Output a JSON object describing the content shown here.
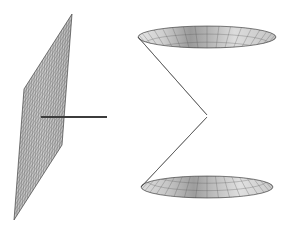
{
  "figure": {
    "background_color": "#ffffff",
    "width": 292,
    "height": 229,
    "objects": [
      {
        "name": "mesh-plane",
        "type": "parallelogram-surface",
        "description": "Shaded quadrilateral mesh surface seen nearly edge-on",
        "corners": [
          [
            72,
            14
          ],
          [
            24,
            89
          ],
          [
            14,
            220
          ],
          [
            62,
            145
          ]
        ],
        "grid_rows": 26,
        "grid_cols": 18,
        "fill_color": "#c9c9c9",
        "line_color": "#5e5e5e",
        "outline_color": "#4a4a4a"
      },
      {
        "name": "axis-line",
        "type": "line-segment",
        "description": "Dark horizontal line extending from inside the plane to the right",
        "x1": 41,
        "y1": 117,
        "x2": 107,
        "y2": 117,
        "color": "#3c3c3c",
        "width": 1.8
      },
      {
        "name": "upper-cone",
        "type": "cone-surface",
        "description": "Inverted wireframe cone, circular rim on top, apex at center",
        "apex": [
          207,
          115
        ],
        "rim_center": [
          207,
          37
        ],
        "rim_radius_x": 69,
        "rim_radius_y": 11,
        "meridians": 36,
        "parallels": 11,
        "fill_color": "#d2d2d2",
        "line_color": "#555555"
      },
      {
        "name": "lower-cone",
        "type": "cone-surface",
        "description": "Upright wireframe cone, apex at center, circular base below",
        "apex": [
          207,
          117
        ],
        "rim_center": [
          207,
          187
        ],
        "rim_radius_x": 66,
        "rim_radius_y": 11,
        "meridians": 36,
        "parallels": 11,
        "fill_color": "#d2d2d2",
        "line_color": "#555555"
      }
    ]
  },
  "colors": {
    "background": "#ffffff",
    "plane_fill": "#c9c9c9",
    "plane_line": "#5e5e5e",
    "cone_fill": "#d2d2d2",
    "cone_line": "#555555",
    "axis_line": "#3c3c3c",
    "cone_shadow": "#8f8f8f",
    "cone_highlight": "#ededed"
  }
}
